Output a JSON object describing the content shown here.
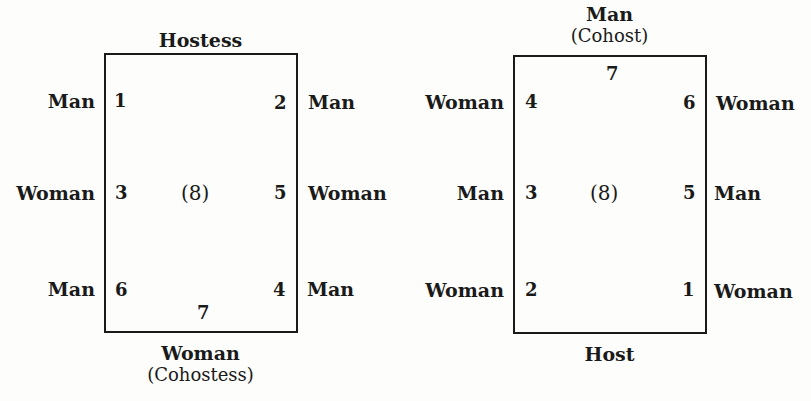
{
  "diagrams": [
    {
      "top_label": "Hostess",
      "bottom_label_line1": "Woman",
      "bottom_label_line2": "(Cohostess)",
      "center": "(8)",
      "seats": {
        "left_top": {
          "num": "1",
          "role": "Man"
        },
        "left_mid": {
          "num": "3",
          "role": "Woman"
        },
        "left_bot": {
          "num": "6",
          "role": "Man"
        },
        "right_top": {
          "num": "2",
          "role": "Man"
        },
        "right_mid": {
          "num": "5",
          "role": "Woman"
        },
        "right_bot": {
          "num": "4",
          "role": "Man"
        },
        "bottom_center": {
          "num": "7"
        }
      }
    },
    {
      "top_label_line1": "Man",
      "top_label_line2": "(Cohost)",
      "bottom_label": "Host",
      "center": "(8)",
      "seats": {
        "top_center": {
          "num": "7"
        },
        "left_top": {
          "num": "4",
          "role": "Woman"
        },
        "left_mid": {
          "num": "3",
          "role": "Man"
        },
        "left_bot": {
          "num": "2",
          "role": "Woman"
        },
        "right_top": {
          "num": "6",
          "role": "Woman"
        },
        "right_mid": {
          "num": "5",
          "role": "Man"
        },
        "right_bot": {
          "num": "1",
          "role": "Woman"
        }
      }
    }
  ]
}
